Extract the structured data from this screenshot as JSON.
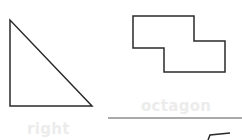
{
  "worksheet": {
    "shapes": [
      {
        "id": "triangle",
        "type": "right-triangle",
        "points": "10,20 10,106 92,106"
      },
      {
        "id": "polygon",
        "type": "octagon",
        "points": "133,16 194,16 194,41 225,41 225,72 164,72 164,48 133,48"
      },
      {
        "id": "partial-shape",
        "type": "partial",
        "points": "208,140 210,135 230,133"
      }
    ],
    "labels": {
      "octagon": "octagon",
      "right": "right"
    },
    "answer_line": {
      "x1": 108,
      "y1": 118,
      "x2": 242,
      "y2": 118
    },
    "colors": {
      "stroke": "#2a2a2a",
      "ghost_text": "#ececec",
      "line": "#555555"
    }
  }
}
